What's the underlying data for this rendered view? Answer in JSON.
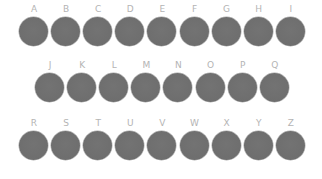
{
  "colors": {
    "background": "#ffffff",
    "label": "#b4b4b4",
    "disc": "#707070"
  },
  "rows": [
    {
      "letters": [
        "A",
        "B",
        "C",
        "D",
        "E",
        "F",
        "G",
        "H",
        "I"
      ]
    },
    {
      "letters": [
        "J",
        "K",
        "L",
        "M",
        "N",
        "O",
        "P",
        "Q"
      ]
    },
    {
      "letters": [
        "R",
        "S",
        "T",
        "U",
        "V",
        "W",
        "X",
        "Y",
        "Z"
      ]
    }
  ]
}
